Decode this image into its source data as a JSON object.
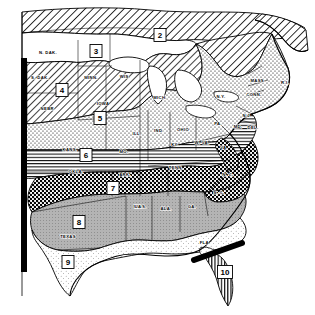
{
  "figure": {
    "kind": "hardiness-zone-map",
    "region": "Eastern United States",
    "background_color": "#ffffff",
    "ink_color": "#000000"
  },
  "zones": [
    {
      "id": "2",
      "label": "2",
      "x": 160,
      "y": 35,
      "pattern": "diagonal-hatch"
    },
    {
      "id": "3",
      "label": "3",
      "x": 96,
      "y": 51,
      "pattern": "white"
    },
    {
      "id": "4",
      "label": "4",
      "x": 62,
      "y": 90,
      "pattern": "diagonal-hatch"
    },
    {
      "id": "5",
      "label": "5",
      "x": 100,
      "y": 118,
      "pattern": "stipple-dots"
    },
    {
      "id": "6",
      "label": "6",
      "x": 86,
      "y": 155,
      "pattern": "horizontal-lines"
    },
    {
      "id": "7",
      "label": "7",
      "x": 113,
      "y": 188,
      "pattern": "cross-hatch-dense"
    },
    {
      "id": "8",
      "label": "8",
      "x": 79,
      "y": 222,
      "pattern": "solid-gray"
    },
    {
      "id": "9",
      "label": "9",
      "x": 68,
      "y": 262,
      "pattern": "fine-stipple"
    },
    {
      "id": "10",
      "label": "10",
      "x": 225,
      "y": 272,
      "pattern": "vertical-lines"
    }
  ],
  "state_labels": [
    {
      "abbr": "N. DAK.",
      "x": 48,
      "y": 53
    },
    {
      "abbr": "S. DAK.",
      "x": 40,
      "y": 78
    },
    {
      "abbr": "MINN.",
      "x": 91,
      "y": 78
    },
    {
      "abbr": "NEBR.",
      "x": 48,
      "y": 109
    },
    {
      "abbr": "IOWA",
      "x": 103,
      "y": 104
    },
    {
      "abbr": "WIS.",
      "x": 125,
      "y": 77
    },
    {
      "abbr": "MICH.",
      "x": 160,
      "y": 98
    },
    {
      "abbr": "ILL.",
      "x": 137,
      "y": 134
    },
    {
      "abbr": "IND.",
      "x": 159,
      "y": 131
    },
    {
      "abbr": "OHIO",
      "x": 183,
      "y": 130
    },
    {
      "abbr": "PA.",
      "x": 218,
      "y": 124
    },
    {
      "abbr": "N.Y.",
      "x": 221,
      "y": 97
    },
    {
      "abbr": "MASS.",
      "x": 258,
      "y": 81
    },
    {
      "abbr": "R.I.",
      "x": 285,
      "y": 83
    },
    {
      "abbr": "CONN.",
      "x": 254,
      "y": 95
    },
    {
      "abbr": "N.J.",
      "x": 247,
      "y": 116
    },
    {
      "abbr": "DEL.",
      "x": 253,
      "y": 128
    },
    {
      "abbr": "MD.",
      "x": 238,
      "y": 127
    },
    {
      "abbr": "MO.",
      "x": 124,
      "y": 152
    },
    {
      "abbr": "KANS.",
      "x": 70,
      "y": 150
    },
    {
      "abbr": "OKLA.",
      "x": 76,
      "y": 172
    },
    {
      "abbr": "ARK.",
      "x": 125,
      "y": 175
    },
    {
      "abbr": "KY.",
      "x": 175,
      "y": 145
    },
    {
      "abbr": "W. VA.",
      "x": 202,
      "y": 143
    },
    {
      "abbr": "VA.",
      "x": 224,
      "y": 148
    },
    {
      "abbr": "TENN.",
      "x": 176,
      "y": 168
    },
    {
      "abbr": "N. C.",
      "x": 228,
      "y": 175
    },
    {
      "abbr": "S. C.",
      "x": 219,
      "y": 193
    },
    {
      "abbr": "MISS.",
      "x": 140,
      "y": 207
    },
    {
      "abbr": "ALA.",
      "x": 166,
      "y": 209
    },
    {
      "abbr": "GA.",
      "x": 192,
      "y": 207
    },
    {
      "abbr": "LA.",
      "x": 139,
      "y": 207
    },
    {
      "abbr": "TEXAS",
      "x": 68,
      "y": 237
    },
    {
      "abbr": "FLA.",
      "x": 205,
      "y": 243
    }
  ],
  "annotations": [
    {
      "name": "left-cut-bar",
      "description": "thick black vertical bar along left map edge"
    },
    {
      "name": "florida-cut-bar",
      "description": "thick black diagonal bar across north Florida"
    }
  ]
}
